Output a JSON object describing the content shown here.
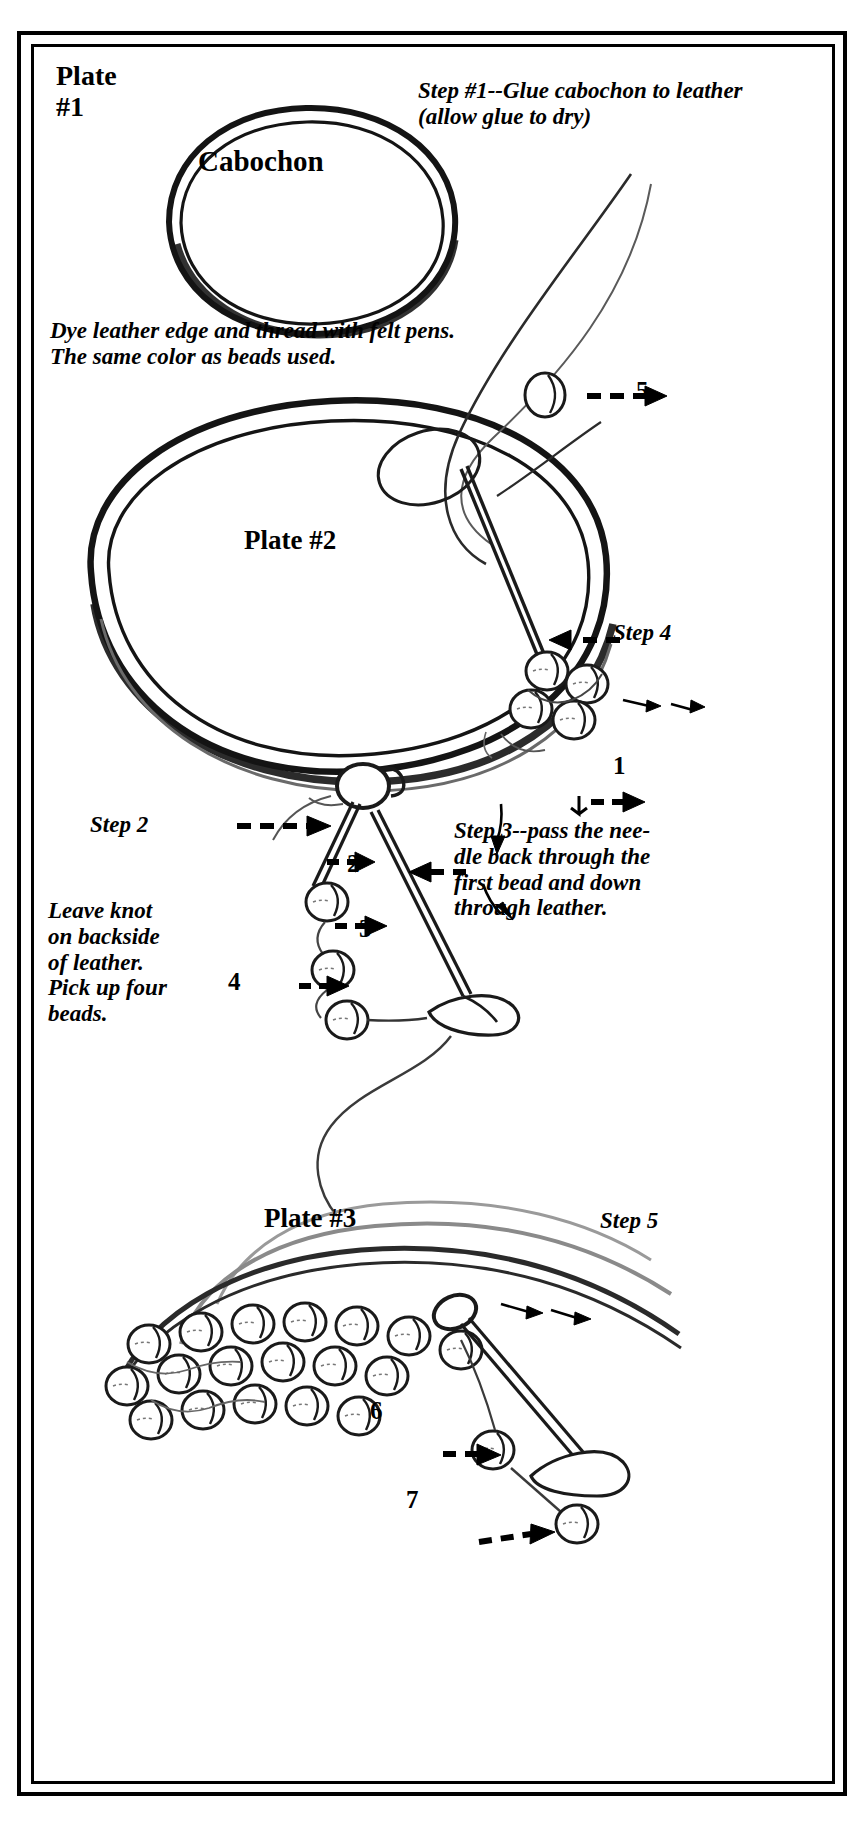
{
  "document": {
    "type": "beadwork-instruction-diagram",
    "medium": "hand-drawn pen illustration, scanned",
    "border_color": "#000000",
    "background_color": "#ffffff",
    "ink_color": "#1a1a1a"
  },
  "plate1": {
    "title": "Plate\n#1",
    "cabochon_label": "Cabochon",
    "step_note": "Step #1--Glue cabochon to leather (allow glue to dry)"
  },
  "notes": {
    "dye": "Dye leather edge and thread with felt pens.  The same color as beads used."
  },
  "plate2": {
    "title": "Plate #2",
    "step2_label": "Step 2",
    "step3_note": "Step 3--pass the nee-\ndle back through the\nfirst bead and down\nthrough leather.",
    "step4_label": "Step 4",
    "leave_knot_note": "Leave knot\non backside\nof leather.\nPick up four\nbeads.",
    "bead_numbers": [
      "1",
      "2",
      "3",
      "4",
      "5"
    ]
  },
  "plate3": {
    "title": "Plate #3",
    "step5_label": "Step 5",
    "bead_numbers": [
      "6",
      "7"
    ]
  }
}
